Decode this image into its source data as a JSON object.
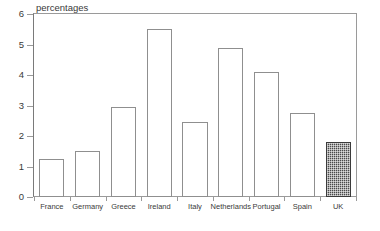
{
  "chart_data": {
    "type": "bar",
    "title": "percentages",
    "xlabel": "",
    "ylabel": "",
    "ylim": [
      0,
      6
    ],
    "yticks": [
      0,
      1,
      2,
      3,
      4,
      5,
      6
    ],
    "grid": false,
    "legend": null,
    "categories": [
      "France",
      "Germany",
      "Greece",
      "Ireland",
      "Italy",
      "Netherlands",
      "Portugal",
      "Spain",
      "UK"
    ],
    "values": [
      1.25,
      1.5,
      2.95,
      5.5,
      2.45,
      4.9,
      4.1,
      2.75,
      1.8
    ],
    "bar_styles": [
      "open",
      "open",
      "open",
      "open",
      "open",
      "open",
      "open",
      "open",
      "hatched"
    ],
    "colors": {
      "bar_outline": "#8f8f8f",
      "bar_fill": "#ffffff",
      "highlight_fill": "#4a4a4a",
      "axis": "#9a9a9a",
      "text": "#3a3a3a",
      "background": "#ffffff"
    }
  },
  "axis": {
    "y_tick_labels": [
      "0",
      "1",
      "2",
      "3",
      "4",
      "5",
      "6"
    ]
  }
}
